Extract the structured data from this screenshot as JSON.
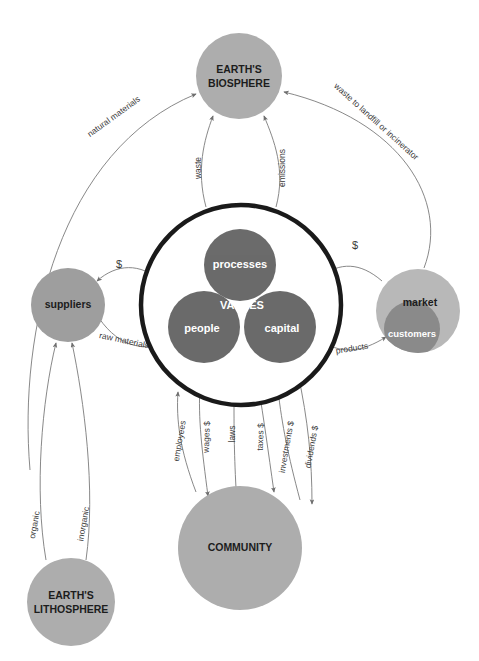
{
  "diagram": {
    "title_visible": false,
    "background": "#ffffff",
    "colors": {
      "dark_circle": "#565656",
      "mid_circle": "#8a8a8a",
      "light_circle": "#adadad",
      "market_light": "#b8b8b8",
      "firm_ring": "#1a1a1a",
      "edge_line": "#7a7a7a",
      "label_text": "#3a3a3a",
      "node_text_dark": "#1c1c1c",
      "node_text_light": "#ffffff"
    },
    "nodes": [
      {
        "id": "biosphere",
        "label": "EARTH'S\nBIOSPHERE",
        "line1": "EARTH'S",
        "line2": "BIOSPHERE",
        "cx": 239,
        "cy": 76,
        "r": 43,
        "fill": "#adadad",
        "text_color": "#1c1c1c",
        "font_size": 10.5,
        "bold": true
      },
      {
        "id": "lithosphere",
        "label": "EARTH'S\nLITHOSPHERE",
        "line1": "EARTH'S",
        "line2": "LITHOSPHERE",
        "cx": 71,
        "cy": 602,
        "r": 44,
        "fill": "#adadad",
        "text_color": "#1c1c1c",
        "font_size": 10.5,
        "bold": true
      },
      {
        "id": "suppliers",
        "label": "suppliers",
        "cx": 68,
        "cy": 305,
        "r": 37,
        "fill": "#9e9e9e",
        "text_color": "#1c1c1c",
        "font_size": 10.5,
        "bold": true
      },
      {
        "id": "market",
        "label": "market",
        "cx": 418,
        "cy": 311,
        "r": 42,
        "fill": "#b8b8b8",
        "text_color": "#1c1c1c",
        "font_size": 10.5,
        "bold": true
      },
      {
        "id": "customers",
        "label": "customers",
        "cx": 412,
        "cy": 329,
        "r": 28,
        "fill": "#8a8a8a",
        "text_color": "#ffffff",
        "font_size": 9.5,
        "bold": true
      },
      {
        "id": "community",
        "label": "COMMUNITY",
        "cx": 240,
        "cy": 548,
        "r": 62,
        "fill": "#adadad",
        "text_color": "#1c1c1c",
        "font_size": 10.5,
        "bold": true
      },
      {
        "id": "processes",
        "label": "processes",
        "cx": 240,
        "cy": 265,
        "r": 36,
        "fill": "#565656",
        "text_color": "#ffffff",
        "font_size": 11,
        "bold": false
      },
      {
        "id": "people",
        "label": "people",
        "cx": 204,
        "cy": 327,
        "r": 36,
        "fill": "#565656",
        "text_color": "#ffffff",
        "font_size": 11,
        "bold": false
      },
      {
        "id": "capital",
        "label": "capital",
        "cx": 280,
        "cy": 327,
        "r": 36,
        "fill": "#565656",
        "text_color": "#ffffff",
        "font_size": 11,
        "bold": false
      }
    ],
    "firm_ring": {
      "cx": 241,
      "cy": 305,
      "r": 100,
      "stroke": "#1a1a1a",
      "stroke_width": 4.5
    },
    "center_label": {
      "text": "VALUES",
      "cx": 242,
      "cy": 306,
      "color": "#ffffff",
      "font_size": 11
    },
    "edges": [
      {
        "id": "natural-materials",
        "label": "natural materials",
        "from": "lithosphere-suppliers-path",
        "to": "biosphere"
      },
      {
        "id": "waste-to-landfill",
        "label": "waste to landfill or incinerator",
        "from": "market",
        "to": "biosphere"
      },
      {
        "id": "waste",
        "label": "waste",
        "from": "firm",
        "to": "biosphere"
      },
      {
        "id": "emissions",
        "label": "emissions",
        "from": "firm",
        "to": "biosphere"
      },
      {
        "id": "dollars-suppliers",
        "label": "$",
        "from": "firm",
        "to": "suppliers"
      },
      {
        "id": "raw-materials",
        "label": "raw materials",
        "from": "suppliers",
        "to": "firm"
      },
      {
        "id": "dollars-market",
        "label": "$",
        "from": "market",
        "to": "firm"
      },
      {
        "id": "products",
        "label": "products",
        "from": "firm",
        "to": "customers"
      },
      {
        "id": "organic",
        "label": "organic",
        "from": "lithosphere",
        "to": "suppliers"
      },
      {
        "id": "inorganic",
        "label": "inorganic",
        "from": "lithosphere",
        "to": "suppliers"
      },
      {
        "id": "employees",
        "label": "employees",
        "from": "community",
        "to": "firm"
      },
      {
        "id": "wages",
        "label": "wages $",
        "from": "firm",
        "to": "community"
      },
      {
        "id": "laws",
        "label": "laws",
        "from": "community",
        "to": "firm"
      },
      {
        "id": "taxes",
        "label": "taxes $",
        "from": "firm",
        "to": "community"
      },
      {
        "id": "investments",
        "label": "investments $",
        "from": "community",
        "to": "firm"
      },
      {
        "id": "dividends",
        "label": "dividends $",
        "from": "firm",
        "to": "community"
      }
    ]
  }
}
